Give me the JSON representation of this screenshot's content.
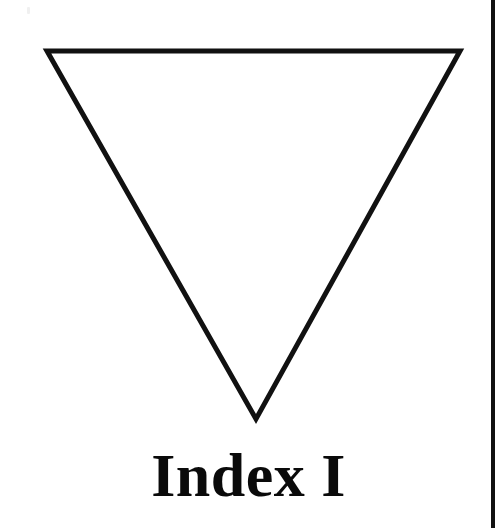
{
  "page": {
    "width": 497,
    "height": 528,
    "background_color": "#ffffff",
    "ink_color": "#0a0a0a"
  },
  "figure": {
    "name": "inverted-triangle",
    "shape": "triangle",
    "orientation": "pointing-down",
    "fill": "none",
    "stroke_color": "#111111",
    "stroke_width": 5,
    "vertices": [
      {
        "label": "top-left",
        "x": 47,
        "y": 51
      },
      {
        "label": "top-right",
        "x": 460,
        "y": 51
      },
      {
        "label": "bottom-apex",
        "x": 256,
        "y": 419
      }
    ]
  },
  "caption": {
    "text": "Index I",
    "font_size": 62,
    "weight": "bold",
    "align": "center",
    "baseline_y": 492
  },
  "border": {
    "name": "right-page-rule",
    "color": "#111111",
    "x": 491,
    "width": 4,
    "top": 0,
    "height": 528
  },
  "artifact": {
    "name": "scan-speck",
    "color": "#f0f0f0",
    "x": 27,
    "y": 7,
    "width": 3,
    "height": 7
  }
}
